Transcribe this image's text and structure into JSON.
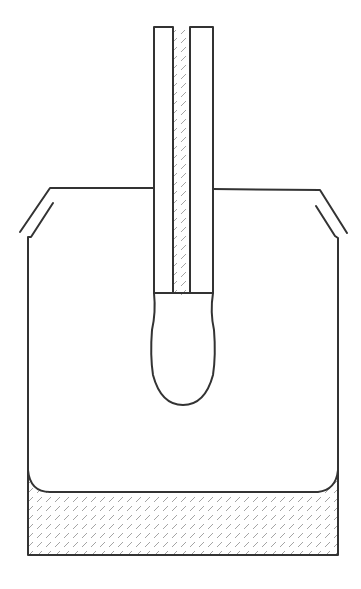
{
  "figure": {
    "type": "diagram",
    "colors": {
      "line": "#333333",
      "hatch": "#9a9a9a",
      "background": "#ffffff"
    },
    "parts": [
      {
        "name": "beaker",
        "description": "open beaker with flared lips"
      },
      {
        "name": "liquid",
        "description": "hatched liquid at bottom of beaker with curved meniscus edges"
      },
      {
        "name": "tube",
        "description": "vertical tube with central hatched capillary"
      },
      {
        "name": "bulb",
        "description": "hatched liquid bulb hanging from tube bottom"
      }
    ]
  }
}
